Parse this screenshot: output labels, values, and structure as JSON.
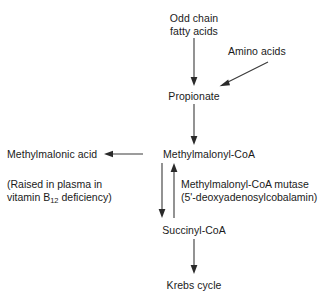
{
  "diagram": {
    "text_color": "#1a1a1a",
    "line_color": "#3a3a3a",
    "background": "#ffffff",
    "nodes": {
      "odd_chain_line1": "Odd chain",
      "odd_chain_line2": "fatty acids",
      "amino_acids": "Amino acids",
      "propionate": "Propionate",
      "methylmalonyl_coa": "Methylmalonyl-CoA",
      "methylmalonic_acid": "Methylmalonic acid",
      "succinyl_coa": "Succinyl-CoA",
      "krebs_cycle": "Krebs cycle"
    },
    "notes": {
      "deficiency_line1": "(Raised in plasma in",
      "deficiency_line2_pre": "vitamin B",
      "deficiency_line2_sub": "12",
      "deficiency_line2_post": " deficiency)",
      "enzyme_line1": "Methylmalonyl-CoA mutase",
      "enzyme_line2": "(5'-deoxyadenosylcobalamin)"
    },
    "arrows": [
      {
        "name": "odd-chain-to-propionate",
        "direction": "down"
      },
      {
        "name": "amino-acids-to-propionate",
        "direction": "diagonal-down-left"
      },
      {
        "name": "propionate-to-methylmalonyl-coa",
        "direction": "down"
      },
      {
        "name": "methylmalonyl-coa-to-methylmalonic-acid",
        "direction": "left"
      },
      {
        "name": "methylmalonyl-coa-to-succinyl-coa",
        "direction": "down"
      },
      {
        "name": "succinyl-coa-to-methylmalonyl-coa",
        "direction": "up"
      },
      {
        "name": "succinyl-coa-to-krebs-cycle",
        "direction": "down"
      }
    ]
  }
}
